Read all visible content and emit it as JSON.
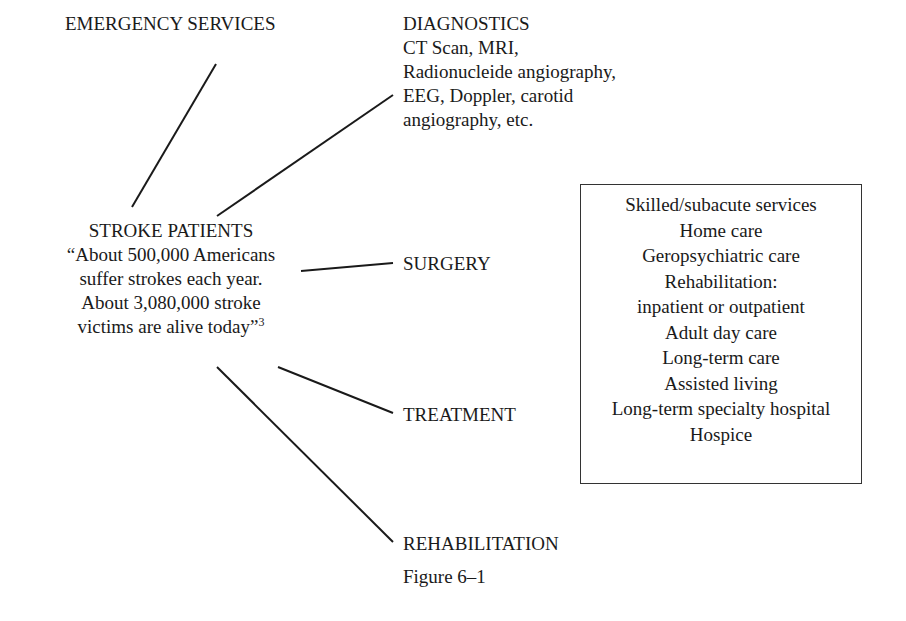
{
  "diagram": {
    "center_node": {
      "title": "STROKE PATIENTS",
      "quote_lines": [
        "“About 500,000 Americans",
        "suffer strokes each year.",
        "About 3,080,000 stroke",
        "victims are alive today”"
      ],
      "footnote_ref": "3"
    },
    "branches": {
      "emergency": "EMERGENCY SERVICES",
      "diagnostics": {
        "title": "DIAGNOSTICS",
        "lines": [
          "CT Scan, MRI,",
          "Radionucleide angiography,",
          "EEG, Doppler, carotid",
          "angiography, etc."
        ]
      },
      "surgery": "SURGERY",
      "treatment": "TREATMENT",
      "rehabilitation": "REHABILITATION"
    },
    "services_box": {
      "items": [
        "Skilled/subacute services",
        "Home care",
        "Geropsychiatric care",
        "Rehabilitation:",
        "inpatient or outpatient",
        "Adult day care",
        "Long-term care",
        "Assisted living",
        "Long-term specialty hospital",
        "Hospice"
      ]
    },
    "caption": "Figure 6–1"
  }
}
